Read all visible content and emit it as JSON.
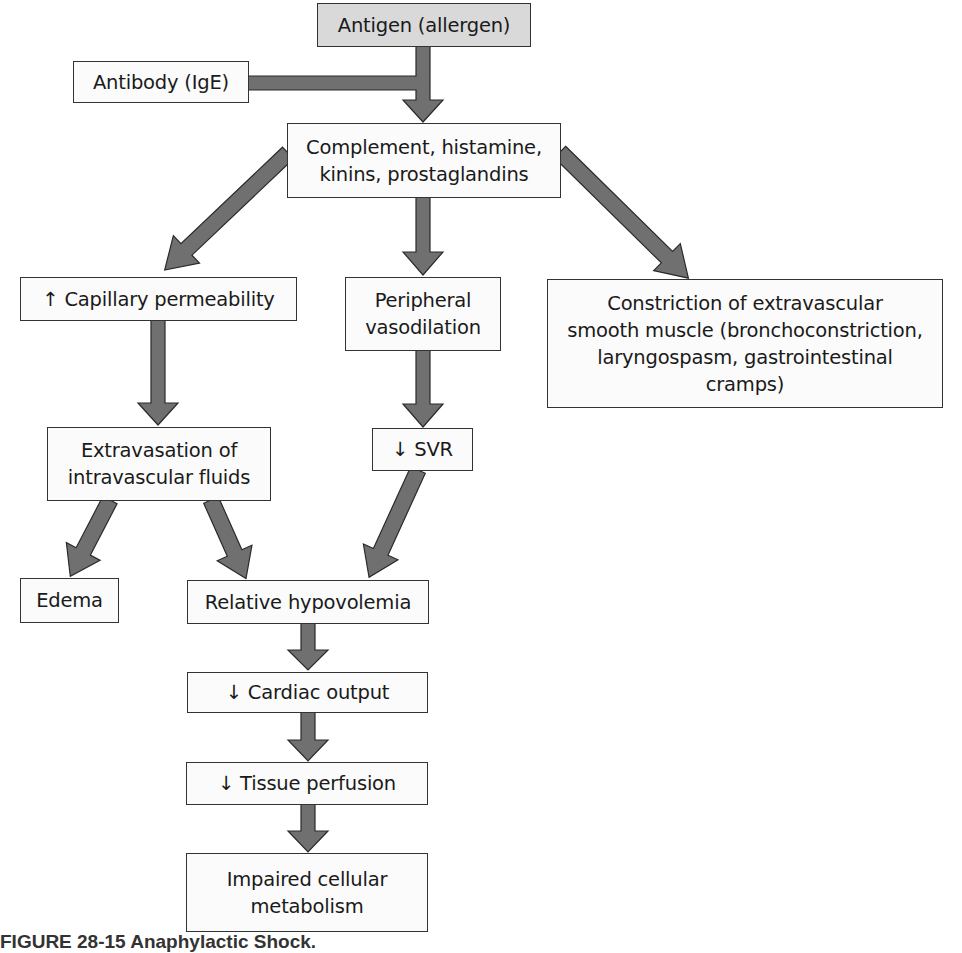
{
  "diagram": {
    "type": "flowchart",
    "arrow_color": "#707070",
    "arrow_outline": "#2a2a2a",
    "box_fill": "#fbfbfb",
    "root_fill": "#d9d9d9",
    "nodes": {
      "antigen": "Antigen (allergen)",
      "antibody": "Antibody (IgE)",
      "mediators_line1": "Complement, histamine,",
      "mediators_line2": "kinins, prostaglandins",
      "capillary": "↑ Capillary permeability",
      "vasodilation_line1": "Peripheral",
      "vasodilation_line2": "vasodilation",
      "constriction_line1": "Constriction of extravascular",
      "constriction_line2": "smooth muscle (bronchoconstriction,",
      "constriction_line3": "laryngospasm, gastrointestinal",
      "constriction_line4": "cramps)",
      "extravasation_line1": "Extravasation of",
      "extravasation_line2": "intravascular fluids",
      "svr": "↓ SVR",
      "edema": "Edema",
      "hypovolemia": "Relative hypovolemia",
      "cardiac": "↓ Cardiac output",
      "perfusion": "↓ Tissue perfusion",
      "impaired_line1": "Impaired cellular",
      "impaired_line2": "metabolism"
    },
    "edges": [
      [
        "antigen",
        "mediators"
      ],
      [
        "antibody",
        "mediators"
      ],
      [
        "mediators",
        "capillary"
      ],
      [
        "mediators",
        "vasodilation"
      ],
      [
        "mediators",
        "constriction"
      ],
      [
        "capillary",
        "extravasation"
      ],
      [
        "vasodilation",
        "svr"
      ],
      [
        "extravasation",
        "edema"
      ],
      [
        "extravasation",
        "hypovolemia"
      ],
      [
        "svr",
        "hypovolemia"
      ],
      [
        "hypovolemia",
        "cardiac"
      ],
      [
        "cardiac",
        "perfusion"
      ],
      [
        "perfusion",
        "impaired"
      ]
    ],
    "caption": "FIGURE 28-15  Anaphylactic Shock."
  }
}
